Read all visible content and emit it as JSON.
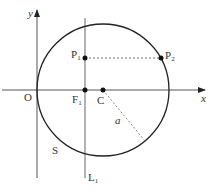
{
  "diagram": {
    "colors": {
      "stroke": "#222222",
      "axis": "#555555",
      "dashed": "#777777",
      "background": "#ffffff"
    },
    "labels": {
      "y_axis": "y",
      "x_axis": "x",
      "origin": "O",
      "focus": "F",
      "focus_sub": "1",
      "center": "C",
      "point1": "P",
      "point1_sub": "1",
      "point2": "P",
      "point2_sub": "2",
      "radius": "a",
      "circle": "S",
      "line": "L",
      "line_sub": "1"
    }
  }
}
